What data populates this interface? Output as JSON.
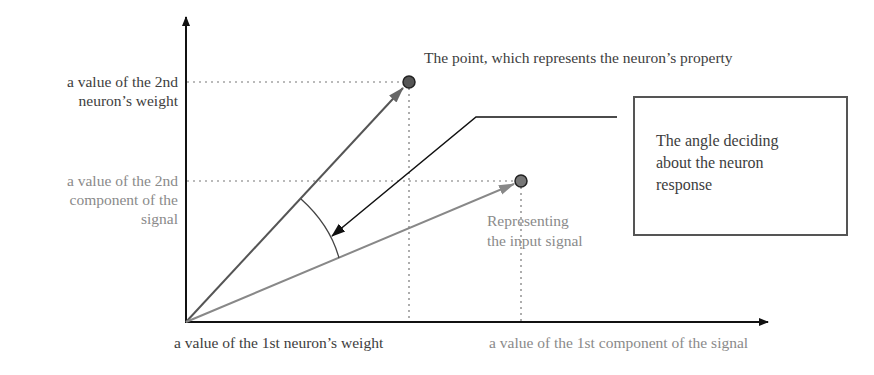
{
  "diagram": {
    "axes": {
      "y_labels": {
        "weight_2nd": "a value of the 2nd\nneuron’s weight",
        "signal_2nd": "a value of the 2nd\ncomponent of the\nsignal"
      },
      "x_labels": {
        "weight_1st": "a value of the 1st neuron’s weight",
        "signal_1st": "a value of the 1st component of the signal"
      }
    },
    "annotations": {
      "neuron_point": "The point, which represents the neuron’s property",
      "input_signal": "Representing\nthe input signal",
      "angle_box": "The angle deciding\nabout the neuron\nresponse"
    },
    "points": [
      {
        "name": "neuron-weight-point",
        "x": 409,
        "y": 82
      },
      {
        "name": "input-signal-point",
        "x": 521,
        "y": 181
      }
    ],
    "colors": {
      "axis": "#111111",
      "weight_vector": "#555555",
      "signal_vector": "#8a8a8a",
      "point_fill": "#555555",
      "point_stroke": "#222222",
      "dotted": "#777777",
      "box_border": "#555555"
    }
  }
}
